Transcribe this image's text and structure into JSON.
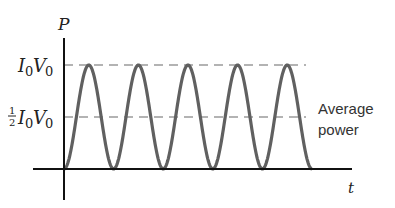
{
  "chart_data": {
    "type": "line",
    "title": "",
    "xlabel": "t",
    "ylabel": "P",
    "y_ticks": [
      {
        "label": "I0V0",
        "display": "I₀V₀",
        "value": 1.0
      },
      {
        "label": "1/2 I0V0",
        "display": "½I₀V₀",
        "value": 0.5
      }
    ],
    "series": [
      {
        "name": "Instantaneous power P = I0V0 sin²(ωt)",
        "function": "sin^2",
        "cycles": 5,
        "min": 0,
        "max": 1.0,
        "color": "#606060"
      }
    ],
    "reference_lines": [
      {
        "name": "Peak power",
        "y": 1.0,
        "style": "dashed",
        "color": "#999999"
      },
      {
        "name": "Average power",
        "y": 0.5,
        "style": "dashed",
        "color": "#999999"
      }
    ],
    "annotations": [
      {
        "text": "Average power",
        "attached_to": "Average power line"
      }
    ],
    "ylim": [
      0,
      1.0
    ],
    "grid": false,
    "legend": "none"
  },
  "labels": {
    "y_axis": "P",
    "x_axis": "t",
    "peak_main": "I",
    "peak_sub1": "0",
    "peak_v": "V",
    "peak_sub2": "0",
    "half_num": "1",
    "half_den": "2",
    "annotation_line1": "Average",
    "annotation_line2": "power"
  }
}
